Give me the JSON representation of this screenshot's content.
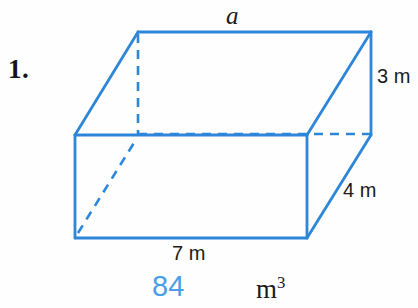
{
  "problem": {
    "number_label": "1.",
    "shape": "rectangular prism"
  },
  "figure": {
    "stroke_color": "#2e86d8",
    "background_color": "#fefefe",
    "solid_line_width": 2.6,
    "dashed_line_width": 2.6,
    "dash_pattern": "9 7",
    "vertices": {
      "front_top_left": [
        75,
        135
      ],
      "front_top_right": [
        307,
        135
      ],
      "front_bottom_left": [
        75,
        238
      ],
      "front_bottom_right": [
        307,
        238
      ],
      "back_top_left": [
        138,
        32
      ],
      "back_top_right": [
        371,
        32
      ],
      "back_bottom_left": [
        138,
        134
      ],
      "back_bottom_right": [
        371,
        134
      ]
    }
  },
  "labels": {
    "top_edge": "a",
    "right_height": "3 m",
    "right_depth": "4 m",
    "bottom_width": "7 m"
  },
  "answer": {
    "value": "84",
    "unit_base": "m",
    "unit_exponent": "3",
    "value_color": "#4a9ee8"
  }
}
